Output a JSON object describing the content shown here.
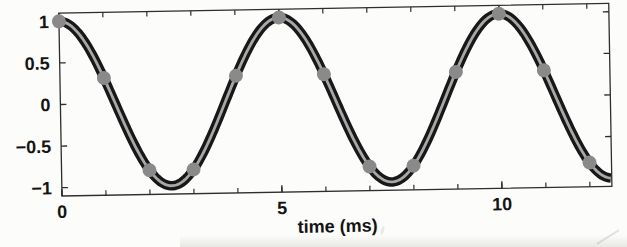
{
  "figure": {
    "background": "#fcfcfa",
    "kind": "scanned textbook plot of a sampled cosine signal"
  },
  "chart_data": {
    "type": "line",
    "title": "",
    "xlabel": "time (ms)",
    "ylabel": "",
    "xlim": [
      0,
      12.5
    ],
    "ylim": [
      -1.1,
      1.1
    ],
    "grid": false,
    "box": true,
    "tick_direction": "in",
    "x_major_ticks": [
      0,
      5,
      10
    ],
    "x_major_tick_labels": [
      "0",
      "5",
      "10"
    ],
    "x_minor_ticks": [
      0,
      1,
      2,
      3,
      4,
      5,
      6,
      7,
      8,
      9,
      10,
      11,
      12
    ],
    "y_ticks": [
      -1,
      -0.5,
      0,
      0.5,
      1
    ],
    "y_tick_labels": [
      "−1",
      "−0.5",
      "0",
      "0.5",
      "1"
    ],
    "series": [
      {
        "name": "continuous cosine signal",
        "type": "line",
        "function": "amplitude * cos(2*pi*t/period_ms)",
        "amplitude": 1,
        "period_ms": 5,
        "t_start": 0,
        "t_end": 12.5,
        "color_outer": "#181818",
        "color_inner": "#a8a8a8",
        "outer_width": 9.5,
        "inner_width": 2.8
      },
      {
        "name": "samples every 1 ms",
        "type": "scatter",
        "marker": "circle",
        "marker_color": "#8a8a8a",
        "marker_radius": 7,
        "x": [
          0,
          1,
          2,
          3,
          4,
          5,
          6,
          7,
          8,
          9,
          10,
          11,
          12
        ],
        "y": [
          1,
          0.309,
          -0.809,
          -0.809,
          0.309,
          1,
          0.309,
          -0.809,
          -0.809,
          0.309,
          1,
          0.309,
          -0.809
        ]
      }
    ],
    "colors": {
      "axis": "#2e2e2e",
      "text": "#141414",
      "background": "#fcfcfa"
    },
    "layout": {
      "tilt_deg": -1,
      "plot_box_px": {
        "left": 62,
        "top": 13,
        "right": 612,
        "bottom": 196
      }
    }
  }
}
